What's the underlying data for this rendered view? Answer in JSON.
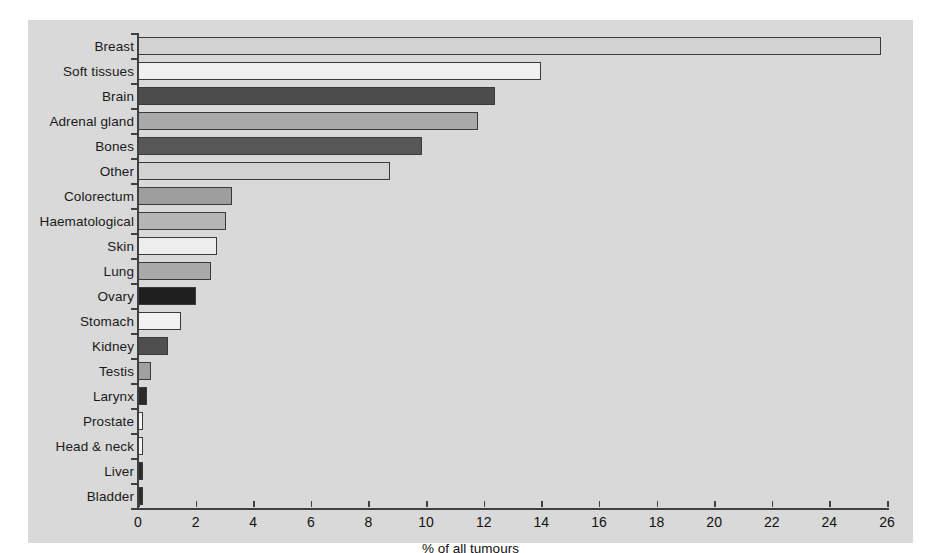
{
  "chart_data": {
    "type": "bar",
    "orientation": "horizontal",
    "title": "",
    "xlabel": "% of all tumours",
    "ylabel": "",
    "xlim": [
      0,
      26
    ],
    "xticks": [
      0,
      2,
      4,
      6,
      8,
      10,
      12,
      14,
      16,
      18,
      20,
      22,
      24,
      26
    ],
    "grid": false,
    "legend": null,
    "categories": [
      "Breast",
      "Soft tissues",
      "Brain",
      "Adrenal  gland",
      "Bones",
      "Other",
      "Colorectum",
      "Haematological",
      "Skin",
      "Lung",
      "Ovary",
      "Stomach",
      "Kidney",
      "Testis",
      "Larynx",
      "Prostate",
      "Head & neck",
      "Liver",
      "Bladder"
    ],
    "values": [
      25.8,
      14.0,
      12.4,
      11.8,
      9.85,
      8.75,
      3.25,
      3.05,
      2.75,
      2.55,
      2.0,
      1.5,
      1.05,
      0.45,
      0.3,
      0.15,
      0.15,
      0.12,
      0.1
    ],
    "bar_colors": [
      "#d2d2d2",
      "#f0f0f0",
      "#4c4c4c",
      "#a9a9a9",
      "#575757",
      "#d2d2d2",
      "#9e9e9e",
      "#b5b5b5",
      "#ededed",
      "#a9a9a9",
      "#1f1f1f",
      "#f2f2f2",
      "#4f4f4f",
      "#a0a0a0",
      "#2b2b2b",
      "#f2f2f2",
      "#f2f2f2",
      "#2b2b2b",
      "#2b2b2b"
    ]
  },
  "colors": {
    "page_background": "#ffffff",
    "panel_background": "#d9d9d9",
    "axis": "#3f3f3f",
    "text": "#111111"
  }
}
